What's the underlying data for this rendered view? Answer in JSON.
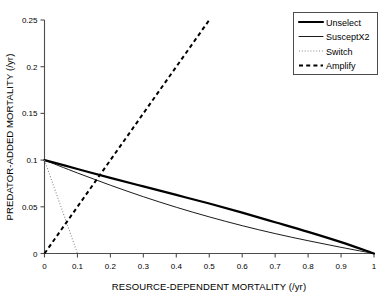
{
  "chart_data": {
    "type": "line",
    "title": "",
    "xlabel": "RESOURCE-DEPENDENT MORTALITY (/yr)",
    "ylabel": "PREDATOR-ADDED MORTALITY (/yr)",
    "xlim": [
      0,
      1
    ],
    "ylim": [
      0,
      0.25
    ],
    "grid": false,
    "legend_position": "top-right",
    "xticks": [
      "0",
      "0.1",
      "0.2",
      "0.3",
      "0.4",
      "0.5",
      "0.6",
      "0.7",
      "0.8",
      "0.9",
      "1"
    ],
    "xtick_values": [
      0,
      0.1,
      0.2,
      0.3,
      0.4,
      0.5,
      0.6,
      0.7,
      0.8,
      0.9,
      1
    ],
    "yticks": [
      "0",
      "0.05",
      "0.1",
      "0.15",
      "0.2",
      "0.25"
    ],
    "ytick_values": [
      0,
      0.05,
      0.1,
      0.15,
      0.2,
      0.25
    ],
    "series": [
      {
        "name": "Unselect",
        "style": "solid",
        "width": 2.2,
        "color": "#000000",
        "x": [
          0,
          0.1,
          0.2,
          0.3,
          0.4,
          0.5,
          0.6,
          0.7,
          0.8,
          0.9,
          1
        ],
        "values": [
          0.1,
          0.0905,
          0.081,
          0.0718,
          0.0627,
          0.0535,
          0.0437,
          0.0335,
          0.0232,
          0.0122,
          0
        ]
      },
      {
        "name": "SusceptX2",
        "style": "solid",
        "width": 0.9,
        "color": "#000000",
        "x": [
          0,
          0.1,
          0.2,
          0.3,
          0.4,
          0.5,
          0.6,
          0.7,
          0.8,
          0.9,
          1
        ],
        "values": [
          0.1,
          0.0862,
          0.0731,
          0.0608,
          0.0495,
          0.0392,
          0.0298,
          0.0213,
          0.0137,
          0.0066,
          0
        ]
      },
      {
        "name": "Switch",
        "style": "dotted",
        "width": 1.1,
        "color": "#8a8a8a",
        "x": [
          0,
          0.1
        ],
        "values": [
          0.1,
          0
        ]
      },
      {
        "name": "Amplify",
        "style": "dashed",
        "width": 2.0,
        "color": "#000000",
        "x": [
          0,
          0.5
        ],
        "values": [
          0,
          0.25
        ]
      }
    ]
  },
  "legend": {
    "items": [
      {
        "label": "Unselect"
      },
      {
        "label": "SusceptX2"
      },
      {
        "label": "Switch"
      },
      {
        "label": "Amplify"
      }
    ]
  }
}
